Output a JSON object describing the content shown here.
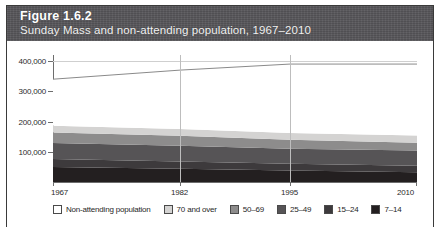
{
  "figure": {
    "number": "Figure 1.6.2",
    "title": "Sunday Mass and non-attending population, 1967–2010"
  },
  "chart_data": {
    "type": "area",
    "title": "Sunday Mass and non-attending population, 1967–2010",
    "xlabel": "",
    "ylabel": "",
    "stacked": true,
    "grid": true,
    "legend_position": "bottom",
    "x": [
      1967,
      1982,
      1995,
      2010
    ],
    "xticklabels": [
      "1967",
      "1982",
      "1995",
      "2010"
    ],
    "yticklabels": [
      "100,000",
      "200,000",
      "300,000",
      "400,000"
    ],
    "ytickvalues": [
      100000,
      200000,
      300000,
      400000
    ],
    "ylim": [
      0,
      420000
    ],
    "series": [
      {
        "name": "7–14",
        "color": "#231f20",
        "values": [
          50000,
          44000,
          38000,
          32000
        ]
      },
      {
        "name": "15–24",
        "color": "#3d3a3c",
        "values": [
          26000,
          24000,
          22000,
          22000
        ]
      },
      {
        "name": "25–49",
        "color": "#565456",
        "values": [
          53000,
          52000,
          50000,
          50000
        ]
      },
      {
        "name": "50–69",
        "color": "#8d8c8c",
        "values": [
          35000,
          33000,
          30000,
          26000
        ]
      },
      {
        "name": "70 and over",
        "color": "#d4d3d2",
        "values": [
          22000,
          22000,
          22000,
          24000
        ]
      },
      {
        "name": "Non-attending population",
        "color": "#ffffff",
        "values": [
          154000,
          195000,
          228000,
          236000
        ]
      }
    ],
    "totals": [
      340000,
      370000,
      390000,
      390000
    ],
    "annotations": []
  },
  "legend": {
    "items": [
      {
        "label": "Non-attending population",
        "color": "#ffffff"
      },
      {
        "label": "70 and over",
        "color": "#d4d3d2"
      },
      {
        "label": "50–69",
        "color": "#8d8c8c"
      },
      {
        "label": "25–49",
        "color": "#565456"
      },
      {
        "label": "15–24",
        "color": "#3d3a3c"
      },
      {
        "label": "7–14",
        "color": "#231f20"
      }
    ]
  },
  "colors": {
    "header_band": "#57565a",
    "frame": "#3a3a3a",
    "axis": "#6d6d6d",
    "gridline": "#cfcfcf"
  }
}
